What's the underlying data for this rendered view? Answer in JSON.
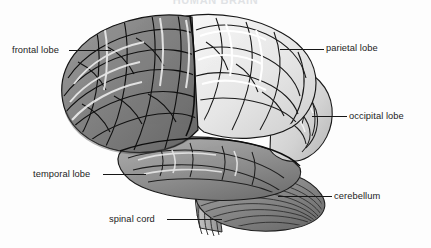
{
  "figure": {
    "title": "HUMAN BRAIN",
    "title_visible": "partially cut off at top edge",
    "view": "lateral (side) view of the human brain",
    "style": "grayscale halftone anatomical illustration",
    "background_color": "#fdfdfd",
    "label_text_color": "#1c1c1c",
    "leader_line_color": "#161616",
    "width": 431,
    "height": 248
  },
  "labels": [
    {
      "id": "frontal-lobe",
      "text": "frontal lobe",
      "text_x": 12,
      "text_y": 46,
      "side": "left",
      "leader_x": 69,
      "leader_y": 50,
      "leader_w": 42
    },
    {
      "id": "parietal-lobe",
      "text": "parietal lobe",
      "text_x": 326,
      "text_y": 44,
      "side": "right",
      "leader_x": 280,
      "leader_y": 49,
      "leader_w": 44
    },
    {
      "id": "occipital-lobe",
      "text": "occipital lobe",
      "text_x": 349,
      "text_y": 112,
      "side": "right",
      "leader_x": 312,
      "leader_y": 116,
      "leader_w": 35
    },
    {
      "id": "temporal-lobe",
      "text": "temporal lobe",
      "text_x": 33,
      "text_y": 170,
      "side": "left",
      "leader_x": 103,
      "leader_y": 174,
      "leader_w": 43
    },
    {
      "id": "cerebellum",
      "text": "cerebellum",
      "text_x": 334,
      "text_y": 192,
      "side": "right",
      "leader_x": 278,
      "leader_y": 196,
      "leader_w": 54
    },
    {
      "id": "spinal-cord",
      "text": "spinal cord",
      "text_x": 109,
      "text_y": 215,
      "side": "left",
      "leader_x": 167,
      "leader_y": 219,
      "leader_w": 55
    }
  ],
  "structures": [
    {
      "id": "frontal-lobe",
      "name": "frontal lobe",
      "shade": "medium-dark gray",
      "color": "#8d8d8d",
      "region": "anterior / left portion of cerebrum"
    },
    {
      "id": "parietal-lobe",
      "name": "parietal lobe",
      "shade": "very light / near white",
      "color": "#ececec",
      "region": "superior-posterior cerebrum"
    },
    {
      "id": "occipital-lobe",
      "name": "occipital lobe",
      "shade": "light gray",
      "color": "#dcdcdc",
      "region": "posterior cerebrum"
    },
    {
      "id": "temporal-lobe",
      "name": "temporal lobe",
      "shade": "medium gray",
      "color": "#9a9a9a",
      "region": "inferior-lateral cerebrum"
    },
    {
      "id": "cerebellum",
      "name": "cerebellum",
      "shade": "medium gray with parallel folia striations",
      "color": "#8a8a8a",
      "region": "postero-inferior, below occipital lobe"
    },
    {
      "id": "spinal-cord",
      "name": "spinal cord",
      "shade": "light gray brainstem continuing downward",
      "color": "#b6b6b6",
      "region": "inferior, descending from brainstem"
    }
  ]
}
